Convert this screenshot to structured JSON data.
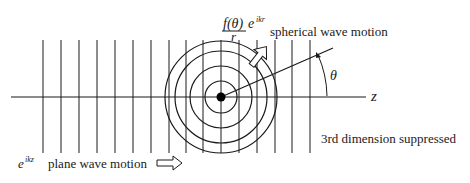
{
  "diagram": {
    "type": "scattering-wave-diagram",
    "colors": {
      "line": "#1a1a1a",
      "background": "#ffffff"
    },
    "labels": {
      "spherical_formula_numerator_f": "f(",
      "spherical_formula_theta": "θ",
      "spherical_formula_close": ")",
      "spherical_formula_e": "e",
      "spherical_formula_exp": "ikr",
      "spherical_formula_denominator": "r",
      "spherical_motion": "spherical wave motion",
      "angle": "θ",
      "axis": "z",
      "suppressed": "3rd dimension suppressed",
      "plane_formula_e": "e",
      "plane_formula_exp": "ikz",
      "plane_motion": "plane wave motion"
    },
    "plane_wavefronts_x": [
      43,
      61,
      79,
      97,
      115,
      133,
      151,
      169,
      186,
      203,
      221,
      239,
      257,
      275,
      292,
      310
    ],
    "wavefront_top_y": 40,
    "wavefront_bottom_y": 153,
    "scatter_center": {
      "x": 221,
      "y": 97
    },
    "spherical_wave_radii": [
      16,
      31,
      46,
      56
    ],
    "axis": {
      "x1": 11,
      "x2": 366,
      "y": 97
    }
  }
}
